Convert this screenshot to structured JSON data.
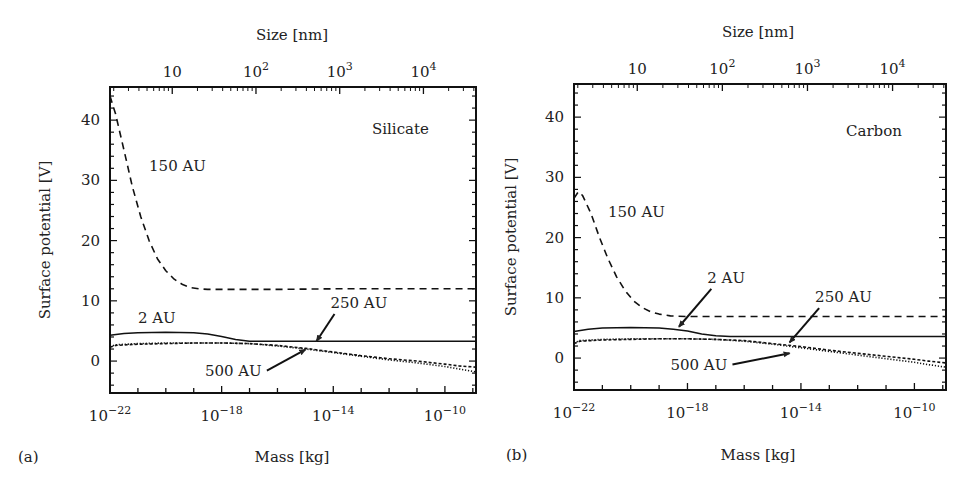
{
  "chart_data": [
    {
      "type": "line",
      "panel_label": "(a)",
      "title": "",
      "material_label": "Silicate",
      "xlabel": "Mass [kg]",
      "ylabel": "Surface potential [V]",
      "top_xlabel": "Size [nm]",
      "xscale": "log",
      "xlim": [
        1e-22,
        1.3e-09
      ],
      "ylim": [
        -5.3,
        45.5
      ],
      "xticks": [
        1e-22,
        1e-18,
        1e-14,
        1e-10
      ],
      "xtick_labels": [
        {
          "base": "10",
          "exp": "−22"
        },
        {
          "base": "10",
          "exp": "−18"
        },
        {
          "base": "10",
          "exp": "−14"
        },
        {
          "base": "10",
          "exp": "−10"
        }
      ],
      "yticks": [
        0,
        10,
        20,
        30,
        40
      ],
      "ytick_labels": [
        "0",
        "10",
        "20",
        "30",
        "40"
      ],
      "top_ticks_mass": [
        1.7e-20,
        1.7e-17,
        1.7e-14,
        1.7e-11
      ],
      "top_tick_labels": [
        {
          "base": "10",
          "exp": ""
        },
        {
          "base": "10",
          "exp": "2"
        },
        {
          "base": "10",
          "exp": "3"
        },
        {
          "base": "10",
          "exp": "4"
        }
      ],
      "grid": false,
      "series": [
        {
          "name": "150 AU",
          "style": "dashed",
          "x_log10": [
            -22,
            -21.8,
            -21.5,
            -21.2,
            -20.9,
            -20.6,
            -20.3,
            -20.0,
            -19.7,
            -19.4,
            -19.1,
            -18.8,
            -18.5,
            -18,
            -16,
            -14,
            -12,
            -10,
            -8.9
          ],
          "y": [
            44,
            41,
            35,
            29,
            24,
            20,
            17,
            15,
            13.6,
            12.7,
            12.2,
            12.0,
            11.9,
            11.9,
            11.9,
            12.0,
            12.0,
            12.0,
            12.0
          ]
        },
        {
          "name": "2 AU",
          "style": "solid",
          "x_log10": [
            -22,
            -21.5,
            -21,
            -20,
            -19,
            -18.5,
            -18,
            -17.5,
            -17,
            -16.5,
            -16,
            -14,
            -12,
            -10,
            -8.9
          ],
          "y": [
            4.3,
            4.6,
            4.7,
            4.8,
            4.7,
            4.5,
            4.1,
            3.6,
            3.3,
            3.3,
            3.3,
            3.3,
            3.3,
            3.3,
            3.3
          ]
        },
        {
          "name": "250 AU",
          "style": "short-dashed",
          "x_log10": [
            -22,
            -21.8,
            -21,
            -20,
            -19,
            -18,
            -17,
            -16,
            -15,
            -14,
            -13,
            -12,
            -11,
            -10,
            -9.5,
            -8.9
          ],
          "y": [
            2.3,
            2.6,
            2.8,
            2.9,
            3.0,
            3.0,
            2.9,
            2.6,
            2.1,
            1.5,
            0.9,
            0.4,
            0.0,
            -0.5,
            -0.8,
            -1.0
          ]
        },
        {
          "name": "500 AU",
          "style": "dotted",
          "x_log10": [
            -22,
            -21.8,
            -21,
            -20,
            -19,
            -18,
            -17,
            -16,
            -15,
            -14,
            -13,
            -12,
            -11,
            -10,
            -9.5,
            -8.9
          ],
          "y": [
            2.4,
            2.7,
            2.9,
            3.0,
            3.0,
            3.0,
            2.9,
            2.5,
            2.0,
            1.4,
            0.8,
            0.2,
            -0.3,
            -0.9,
            -1.3,
            -1.8
          ]
        }
      ],
      "annotations": [
        {
          "text": "150 AU",
          "at_log10": -20.6,
          "at_y": 31.5,
          "arrow": false
        },
        {
          "text": "2 AU",
          "at_log10": -21.0,
          "at_y": 6.3,
          "arrow": false
        },
        {
          "text": "250 AU",
          "at_log10": -14.1,
          "at_y": 8.8,
          "arrow": true,
          "arrow_to_log10": -14.6,
          "arrow_to_y": 3.3
        },
        {
          "text": "500 AU",
          "at_log10": -18.6,
          "at_y": -2.4,
          "arrow": true,
          "arrow_to_log10": -15.0,
          "arrow_to_y": 1.9
        }
      ]
    },
    {
      "type": "line",
      "panel_label": "(b)",
      "title": "",
      "material_label": "Carbon",
      "xlabel": "Mass [kg]",
      "ylabel": "Surface potential [V]",
      "top_xlabel": "Size [nm]",
      "xscale": "log",
      "xlim": [
        1e-22,
        1.3e-09
      ],
      "ylim": [
        -5.3,
        45.5
      ],
      "xticks": [
        1e-22,
        1e-18,
        1e-14,
        1e-10
      ],
      "xtick_labels": [
        {
          "base": "10",
          "exp": "−22"
        },
        {
          "base": "10",
          "exp": "−18"
        },
        {
          "base": "10",
          "exp": "−14"
        },
        {
          "base": "10",
          "exp": "−10"
        }
      ],
      "yticks": [
        0,
        10,
        20,
        30,
        40
      ],
      "ytick_labels": [
        "0",
        "10",
        "20",
        "30",
        "40"
      ],
      "top_ticks_mass": [
        1.7e-20,
        1.7e-17,
        1.7e-14,
        1.7e-11
      ],
      "top_tick_labels": [
        {
          "base": "10",
          "exp": ""
        },
        {
          "base": "10",
          "exp": "2"
        },
        {
          "base": "10",
          "exp": "3"
        },
        {
          "base": "10",
          "exp": "4"
        }
      ],
      "grid": false,
      "series": [
        {
          "name": "150 AU",
          "style": "dashed",
          "x_log10": [
            -22,
            -21.85,
            -21.7,
            -21.4,
            -21.1,
            -20.8,
            -20.5,
            -20.2,
            -19.9,
            -19.6,
            -19.3,
            -19.0,
            -18.6,
            -18,
            -16,
            -14,
            -12,
            -10,
            -8.9
          ],
          "y": [
            26.5,
            27.6,
            27.0,
            24,
            20,
            16.5,
            13.5,
            11.2,
            9.5,
            8.4,
            7.7,
            7.3,
            7.0,
            6.9,
            6.9,
            6.9,
            6.9,
            6.9,
            6.9
          ]
        },
        {
          "name": "2 AU",
          "style": "solid",
          "x_log10": [
            -22,
            -21.5,
            -21,
            -20,
            -19,
            -18.5,
            -18,
            -17.5,
            -17,
            -16.5,
            -16,
            -14,
            -12,
            -10,
            -8.9
          ],
          "y": [
            4.4,
            4.8,
            5.0,
            5.1,
            5.0,
            4.8,
            4.5,
            4.0,
            3.7,
            3.6,
            3.6,
            3.6,
            3.6,
            3.6,
            3.6
          ]
        },
        {
          "name": "250 AU",
          "style": "short-dashed",
          "x_log10": [
            -22,
            -21.8,
            -21,
            -20,
            -19,
            -18,
            -17,
            -16,
            -15,
            -14,
            -13,
            -12,
            -11,
            -10,
            -9.5,
            -8.9
          ],
          "y": [
            2.4,
            2.8,
            3.0,
            3.1,
            3.2,
            3.2,
            3.1,
            2.9,
            2.4,
            1.9,
            1.3,
            0.8,
            0.3,
            -0.2,
            -0.5,
            -0.8
          ]
        },
        {
          "name": "500 AU",
          "style": "dotted",
          "x_log10": [
            -22,
            -21.8,
            -21,
            -20,
            -19,
            -18,
            -17,
            -16,
            -15,
            -14,
            -13,
            -12,
            -11,
            -10,
            -9.5,
            -8.9
          ],
          "y": [
            2.5,
            2.9,
            3.1,
            3.2,
            3.2,
            3.2,
            3.1,
            2.8,
            2.3,
            1.7,
            1.1,
            0.5,
            -0.1,
            -0.7,
            -1.1,
            -1.5
          ]
        }
      ],
      "annotations": [
        {
          "text": "150 AU",
          "at_log10": -20.8,
          "at_y": 23.5,
          "arrow": false
        },
        {
          "text": "2 AU",
          "at_log10": -17.3,
          "at_y": 12.5,
          "arrow": true,
          "arrow_to_log10": -18.3,
          "arrow_to_y": 5.2
        },
        {
          "text": "250 AU",
          "at_log10": -13.5,
          "at_y": 9.3,
          "arrow": true,
          "arrow_to_log10": -14.4,
          "arrow_to_y": 2.6
        },
        {
          "text": "500 AU",
          "at_log10": -18.6,
          "at_y": -1.9,
          "arrow": true,
          "arrow_to_log10": -14.4,
          "arrow_to_y": 0.8
        }
      ]
    }
  ]
}
